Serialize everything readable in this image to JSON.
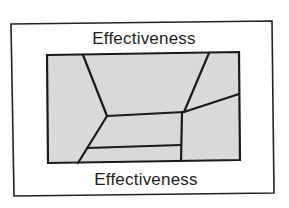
{
  "diagram": {
    "top_label": "Effectiveness",
    "bottom_label": "Effectiveness",
    "colors": {
      "background": "#ffffff",
      "frame_stroke": "#222222",
      "region_fill": "#d9d9d9",
      "line_stroke": "#1a1a1a",
      "text": "#1e1e1e"
    },
    "outer_frame": {
      "points": [
        [
          11,
          24
        ],
        [
          272,
          21
        ],
        [
          274,
          193
        ],
        [
          14,
          196
        ]
      ]
    },
    "inner_box": {
      "points": [
        [
          47,
          55
        ],
        [
          239,
          52
        ],
        [
          240,
          160
        ],
        [
          48,
          163
        ]
      ]
    },
    "segments": [
      {
        "name": "upper-left-diagonal",
        "from": [
          83,
          55
        ],
        "to": [
          107,
          116
        ]
      },
      {
        "name": "upper-right-diagonal",
        "from": [
          209,
          53
        ],
        "to": [
          184,
          112
        ]
      },
      {
        "name": "middle-horizontal",
        "from": [
          107,
          116
        ],
        "to": [
          184,
          112
        ]
      },
      {
        "name": "right-branch",
        "from": [
          184,
          112
        ],
        "to": [
          239,
          94
        ]
      },
      {
        "name": "lower-left-diagonal",
        "from": [
          107,
          116
        ],
        "to": [
          78,
          163
        ]
      },
      {
        "name": "lower-horizontal",
        "from": [
          87,
          148
        ],
        "to": [
          181,
          145
        ]
      },
      {
        "name": "center-vertical",
        "from": [
          182,
          112
        ],
        "to": [
          181,
          161
        ]
      }
    ]
  }
}
